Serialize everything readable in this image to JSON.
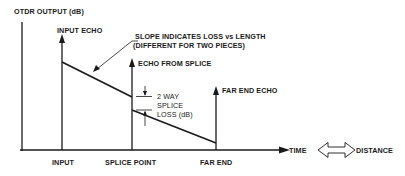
{
  "diagram": {
    "y_axis_label": "OTDR OUTPUT (dB)",
    "x_axis_ticks": [
      "INPUT",
      "SPLICE POINT",
      "FAR END"
    ],
    "echo_labels": {
      "input": "INPUT ECHO",
      "splice": "ECHO FROM SPLICE",
      "far_end": "FAR END ECHO"
    },
    "slope_annotation": {
      "line1": "SLOPE INDICATES LOSS vs LENGTH",
      "line2": "(DIFFERENT FOR TWO PIECES)"
    },
    "splice_loss_annotation": {
      "line1": "2 WAY",
      "line2": "SPLICE",
      "line3": "LOSS (dB)"
    },
    "equivalence": {
      "left": "TIME",
      "right": "DISTANCE"
    },
    "colors": {
      "ink": "#1a1a1a",
      "background": "#ffffff"
    }
  }
}
